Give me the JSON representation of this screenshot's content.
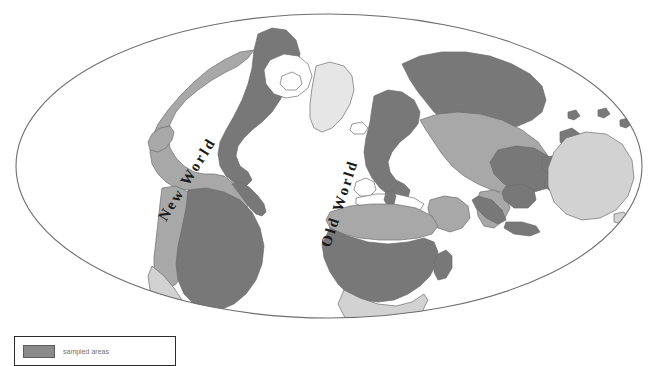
{
  "figure": {
    "name": "world-map",
    "projection": "elliptical",
    "background_color": "#ffffff",
    "frame_color": "#6e6e6e"
  },
  "labels": [
    {
      "id": "new-world",
      "text": "New World",
      "rotation": -58
    },
    {
      "id": "old-world",
      "text": "Old World",
      "rotation": -72
    }
  ],
  "colors": {
    "dark_gray": "#787878",
    "medium_gray": "#a8a8a8",
    "light_gray": "#d2d2d2",
    "pale_gray": "#e6e6e6",
    "outline": "#6e6e6e",
    "ocean": "#ffffff",
    "label_text": "#1a1a1a"
  },
  "legend": {
    "swatch_color": "#8a8a8a",
    "label": "sampled areas",
    "border_color": "#2b2b2b"
  },
  "regions": [
    {
      "name": "north-america",
      "shade": "medium_gray"
    },
    {
      "name": "north-america-boreal",
      "shade": "dark_gray"
    },
    {
      "name": "south-america",
      "shade": "dark_gray"
    },
    {
      "name": "south-america-andes",
      "shade": "medium_gray"
    },
    {
      "name": "south-america-south-cone",
      "shade": "light_gray"
    },
    {
      "name": "greenland",
      "shade": "pale_gray"
    },
    {
      "name": "europe",
      "shade": "dark_gray"
    },
    {
      "name": "north-eurasia",
      "shade": "dark_gray"
    },
    {
      "name": "central-asia",
      "shade": "medium_gray"
    },
    {
      "name": "africa",
      "shade": "dark_gray"
    },
    {
      "name": "africa-sahara",
      "shade": "medium_gray"
    },
    {
      "name": "africa-south",
      "shade": "light_gray"
    },
    {
      "name": "southeast-asia",
      "shade": "dark_gray"
    },
    {
      "name": "australia",
      "shade": "light_gray"
    },
    {
      "name": "madagascar",
      "shade": "dark_gray"
    }
  ]
}
